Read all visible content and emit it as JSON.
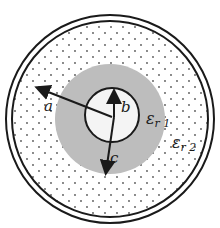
{
  "diagram": {
    "type": "coaxial cross-section",
    "labels": {
      "a": "a",
      "b": "b",
      "c": "c",
      "eps1_base": "ε",
      "eps1_sub": "r 1",
      "eps2_base": "ε",
      "eps2_sub": "r 2"
    },
    "colors": {
      "outline": "#1a1a1a",
      "dielectric1": "#bdbdbd",
      "dielectric2": "#ffffff",
      "dots": "#555555"
    }
  }
}
